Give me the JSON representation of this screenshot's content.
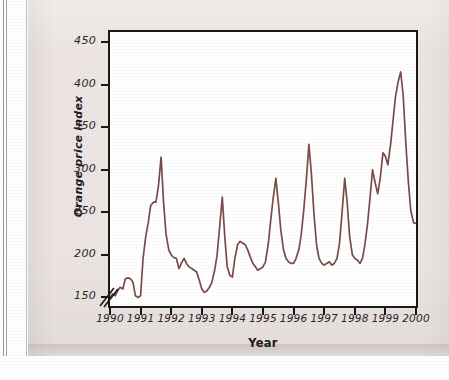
{
  "figure": {
    "background_color": "#ece5e3",
    "plot_background_color": "#ffffff",
    "frame_color": "#171717",
    "line_color": "#7a4a48"
  },
  "chart_data": {
    "type": "line",
    "title": "",
    "xlabel": "Year",
    "ylabel": "Orange price index",
    "xlim": [
      1990,
      2000
    ],
    "ylim": [
      140,
      462
    ],
    "grid": false,
    "legend": null,
    "axis_break": "y-axis break below 150",
    "ytick_labels": [
      "150",
      "200",
      "250",
      "300",
      "350",
      "400",
      "450"
    ],
    "ytick_values": [
      150,
      200,
      250,
      300,
      350,
      400,
      450
    ],
    "xtick_labels": [
      "1990",
      "1991",
      "1992",
      "1993",
      "1994",
      "1995",
      "1996",
      "1997",
      "1998",
      "1999",
      "2000"
    ],
    "xtick_values": [
      1990,
      1991,
      1992,
      1993,
      1994,
      1995,
      1996,
      1997,
      1998,
      1999,
      2000
    ],
    "series": [
      {
        "name": "Orange price index",
        "color": "#7a4a48",
        "x": [
          1990.0,
          1990.08,
          1990.17,
          1990.25,
          1990.33,
          1990.42,
          1990.5,
          1990.58,
          1990.67,
          1990.75,
          1990.83,
          1990.92,
          1991.0,
          1991.08,
          1991.17,
          1991.25,
          1991.33,
          1991.42,
          1991.5,
          1991.58,
          1991.67,
          1991.75,
          1991.83,
          1991.92,
          1992.0,
          1992.08,
          1992.17,
          1992.25,
          1992.33,
          1992.42,
          1992.5,
          1992.58,
          1992.67,
          1992.75,
          1992.83,
          1992.92,
          1993.0,
          1993.08,
          1993.17,
          1993.25,
          1993.33,
          1993.42,
          1993.5,
          1993.58,
          1993.67,
          1993.75,
          1993.83,
          1993.92,
          1994.0,
          1994.08,
          1994.17,
          1994.25,
          1994.33,
          1994.42,
          1994.5,
          1994.58,
          1994.67,
          1994.75,
          1994.83,
          1994.92,
          1995.0,
          1995.08,
          1995.17,
          1995.25,
          1995.33,
          1995.42,
          1995.5,
          1995.58,
          1995.67,
          1995.75,
          1995.83,
          1995.92,
          1996.0,
          1996.08,
          1996.17,
          1996.25,
          1996.33,
          1996.42,
          1996.5,
          1996.58,
          1996.67,
          1996.75,
          1996.83,
          1996.92,
          1997.0,
          1997.08,
          1997.17,
          1997.25,
          1997.33,
          1997.42,
          1997.5,
          1997.58,
          1997.67,
          1997.75,
          1997.83,
          1997.92,
          1998.0,
          1998.08,
          1998.17,
          1998.25,
          1998.33,
          1998.42,
          1998.5,
          1998.58,
          1998.67,
          1998.75,
          1998.83,
          1998.92,
          1999.0,
          1999.08,
          1999.17,
          1999.25,
          1999.33,
          1999.42,
          1999.5,
          1999.58,
          1999.67,
          1999.75,
          1999.83,
          1999.92,
          2000.0
        ],
        "y": [
          150,
          154,
          152,
          158,
          162,
          160,
          172,
          173,
          172,
          168,
          152,
          150,
          152,
          196,
          222,
          238,
          258,
          262,
          262,
          280,
          315,
          262,
          225,
          206,
          200,
          197,
          196,
          184,
          190,
          196,
          190,
          186,
          184,
          182,
          180,
          170,
          160,
          156,
          158,
          162,
          168,
          182,
          200,
          232,
          268,
          222,
          186,
          176,
          174,
          196,
          212,
          216,
          214,
          212,
          206,
          198,
          190,
          186,
          182,
          184,
          186,
          192,
          212,
          240,
          266,
          290,
          262,
          230,
          206,
          196,
          192,
          190,
          190,
          196,
          206,
          224,
          252,
          290,
          330,
          296,
          246,
          212,
          196,
          190,
          188,
          190,
          192,
          188,
          190,
          196,
          214,
          248,
          290,
          262,
          222,
          200,
          196,
          194,
          190,
          196,
          212,
          238,
          268,
          300,
          284,
          272,
          290,
          320,
          316,
          306,
          330,
          358,
          386,
          404,
          415,
          388,
          330,
          286,
          252,
          238,
          237
        ]
      }
    ]
  }
}
